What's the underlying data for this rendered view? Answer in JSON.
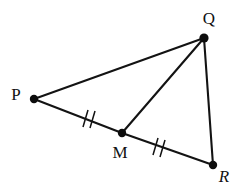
{
  "figure": {
    "type": "geometry-diagram",
    "background_color": "#ffffff",
    "stroke_color": "#131313",
    "points": [
      {
        "id": "P",
        "label": "P",
        "style": "upright",
        "x": 34,
        "y": 99,
        "label_x": 16,
        "label_y": 96,
        "dot_r": 4.2
      },
      {
        "id": "Q",
        "label": "Q",
        "style": "upright",
        "x": 204,
        "y": 38,
        "label_x": 209,
        "label_y": 20,
        "dot_r": 4.6
      },
      {
        "id": "M",
        "label": "M",
        "style": "upright",
        "x": 122,
        "y": 133,
        "label_x": 120,
        "label_y": 154,
        "dot_r": 4.2
      },
      {
        "id": "R",
        "label": "R",
        "style": "italic",
        "x": 213,
        "y": 165,
        "label_x": 224,
        "label_y": 178,
        "dot_r": 4.2
      }
    ],
    "segments": [
      {
        "id": "PQ",
        "from": "P",
        "to": "Q",
        "x1": 34,
        "y1": 99,
        "x2": 204,
        "y2": 38
      },
      {
        "id": "PM",
        "from": "P",
        "to": "M",
        "x1": 34,
        "y1": 99,
        "x2": 122,
        "y2": 133
      },
      {
        "id": "MR",
        "from": "M",
        "to": "R",
        "x1": 122,
        "y1": 133,
        "x2": 213,
        "y2": 165
      },
      {
        "id": "QM",
        "from": "Q",
        "to": "M",
        "x1": 204,
        "y1": 38,
        "x2": 122,
        "y2": 133
      },
      {
        "id": "QR",
        "from": "Q",
        "to": "R",
        "x1": 204,
        "y1": 38,
        "x2": 213,
        "y2": 165
      }
    ],
    "congruence_marks": [
      {
        "id": "tick-PM",
        "on_segment": "PM",
        "count": 2,
        "center_x": 88,
        "center_y": 120,
        "strokes": [
          {
            "x1": 83,
            "y1": 127,
            "x2": 88,
            "y2": 110
          },
          {
            "x1": 90,
            "y1": 128,
            "x2": 95,
            "y2": 111
          }
        ]
      },
      {
        "id": "tick-MR",
        "on_segment": "MR",
        "count": 2,
        "center_x": 158,
        "center_y": 147,
        "strokes": [
          {
            "x1": 153,
            "y1": 155,
            "x2": 158,
            "y2": 138
          },
          {
            "x1": 160,
            "y1": 157,
            "x2": 165,
            "y2": 140
          }
        ]
      }
    ]
  }
}
